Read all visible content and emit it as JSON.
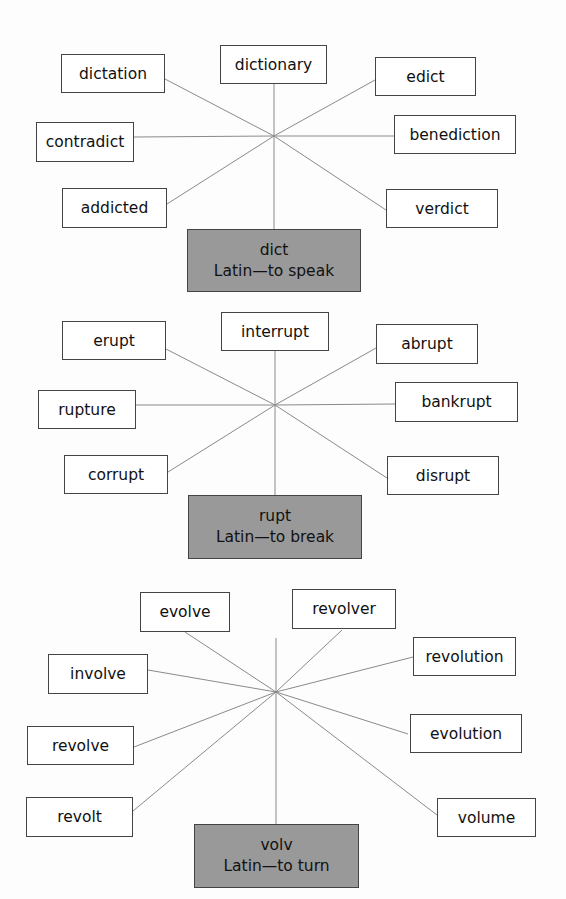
{
  "diagrams": [
    {
      "root": "dict",
      "meaning": "Latin—to speak",
      "words": [
        "dictation",
        "dictionary",
        "edict",
        "contradict",
        "benediction",
        "addicted",
        "verdict"
      ]
    },
    {
      "root": "rupt",
      "meaning": "Latin—to break",
      "words": [
        "erupt",
        "interrupt",
        "abrupt",
        "rupture",
        "bankrupt",
        "corrupt",
        "disrupt"
      ]
    },
    {
      "root": "volv",
      "meaning": "Latin—to turn",
      "words": [
        "evolve",
        "revolver",
        "revolution",
        "involve",
        "evolution",
        "revolve",
        "revolt",
        "volume"
      ]
    }
  ],
  "colors": {
    "root_box": "#999999",
    "word_box": "#ffffff",
    "line": "#888888"
  }
}
